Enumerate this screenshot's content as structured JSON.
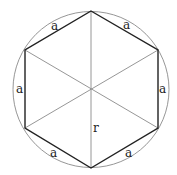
{
  "colors": {
    "background": "#ffffff",
    "hexagon_edge": "#222222",
    "circle": "#888888",
    "diagonal": "#888888",
    "label": "#222222"
  },
  "geometry": {
    "center": [
      91,
      89
    ],
    "radius": 78,
    "vertices": [
      [
        91,
        11
      ],
      [
        158,
        50
      ],
      [
        158,
        128
      ],
      [
        91,
        168
      ],
      [
        25,
        128
      ],
      [
        25,
        50
      ]
    ]
  },
  "labels": {
    "side_top_left": "a",
    "side_top_right": "a",
    "side_left": "a",
    "side_right": "a",
    "side_bottom_left": "a",
    "side_bottom_right": "a",
    "radius": "r"
  }
}
